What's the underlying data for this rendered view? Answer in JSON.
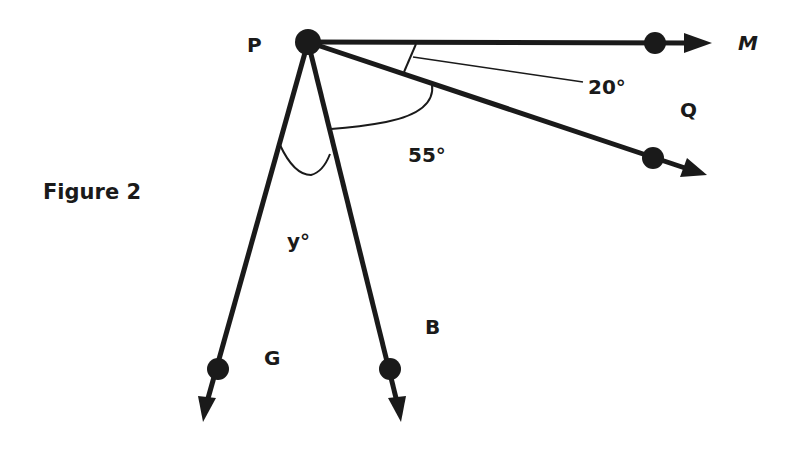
{
  "figure": {
    "title": "Figure 2",
    "vertex": {
      "label": "P",
      "x": 308,
      "y": 42
    },
    "rays": [
      {
        "name": "M",
        "label": "M",
        "dot": [
          655,
          43
        ],
        "tip": [
          712,
          43
        ],
        "label_pos": [
          738,
          50
        ],
        "italic": true
      },
      {
        "name": "Q",
        "label": "Q",
        "dot": [
          653,
          158
        ],
        "tip": [
          707,
          175
        ],
        "label_pos": [
          680,
          117
        ],
        "italic": false
      },
      {
        "name": "B",
        "label": "B",
        "dot": [
          390,
          369
        ],
        "tip": [
          401,
          422
        ],
        "label_pos": [
          425,
          334
        ],
        "italic": false
      },
      {
        "name": "G",
        "label": "G",
        "dot": [
          218,
          369
        ],
        "tip": [
          203,
          422
        ],
        "label_pos": [
          264,
          365
        ],
        "italic": false
      }
    ],
    "angles": [
      {
        "id": "angle-MPQ",
        "label": "20°",
        "label_pos": [
          588,
          94
        ]
      },
      {
        "id": "angle-QPB",
        "label": "55°",
        "label_pos": [
          408,
          162
        ]
      },
      {
        "id": "angle-BPG",
        "label": "y°",
        "label_pos": [
          287,
          248
        ]
      }
    ],
    "colors": {
      "stroke": "#1a1a1a",
      "background": "#ffffff"
    }
  }
}
